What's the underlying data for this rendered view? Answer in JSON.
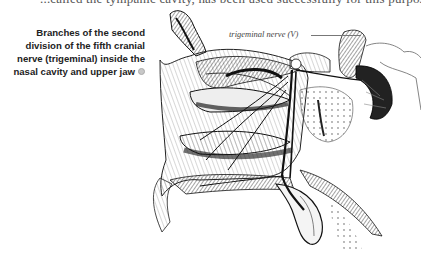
{
  "page": {
    "clipped_top_text": "...called the tympanic cavity, has been used successfully for this purpose."
  },
  "figure": {
    "caption": "Branches of the second division of the fifth cranial nerve (trigeminal) inside the nasal cavity and upper jaw",
    "caption_marker_icon": "info-dot-icon",
    "labels": {
      "trigeminal": "trigeminal nerve (V)",
      "concha_middle": "Concha",
      "nasal_branches": "Nasal Branches",
      "concha_inferior": "Inferior Concha",
      "hard_palate": "Hard Palate",
      "posterior_palatine": "Posterior Palatine N.",
      "second_division": "2nd",
      "gasserian": "Gass."
    },
    "style": {
      "ink_color": "#1a1a1a",
      "caption_color": "#222222",
      "background": "#ffffff"
    }
  }
}
